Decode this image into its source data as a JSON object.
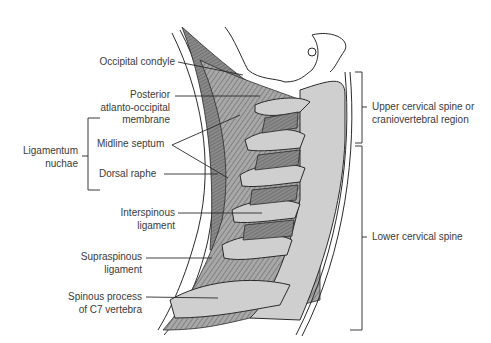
{
  "figure": {
    "colors": {
      "ligament_dark": "#6e6e6e",
      "ligament_mid": "#9a9a9a",
      "bone": "#cfcfcf",
      "outline": "#2a2a2a",
      "text": "#3a3a3a"
    }
  },
  "labels": {
    "occipital_condyle": "Occipital condyle",
    "posterior_aom_1": "Posterior",
    "posterior_aom_2": "atlanto-occipital",
    "posterior_aom_3": "membrane",
    "ligamentum_nuchae_1": "Ligamentum",
    "ligamentum_nuchae_2": "nuchae",
    "midline_septum": "Midline septum",
    "dorsal_raphe": "Dorsal raphe",
    "interspinous_1": "Interspinous",
    "interspinous_2": "ligament",
    "supraspinous_1": "Supraspinous",
    "supraspinous_2": "ligament",
    "spinous_c7_1": "Spinous process",
    "spinous_c7_2": "of C7 vertebra",
    "upper_region_1": "Upper cervical spine or",
    "upper_region_2": "craniovertebral region",
    "lower_region": "Lower cervical spine"
  }
}
